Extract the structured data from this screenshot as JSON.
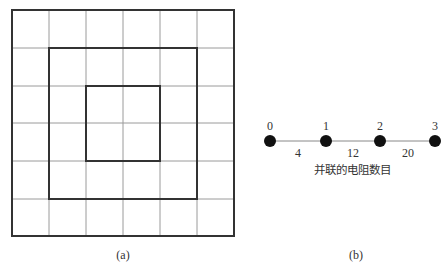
{
  "panel_a": {
    "caption": "(a)",
    "grid": {
      "rows": 6,
      "cols": 6,
      "cell_px": 37
    },
    "squares": [
      {
        "name": "outer",
        "cells": 6
      },
      {
        "name": "middle",
        "cells": 4
      },
      {
        "name": "inner",
        "cells": 2
      }
    ]
  },
  "panel_b": {
    "caption": "(b)",
    "axis_label": "并联的电阻数目",
    "nodes": [
      {
        "label": "0"
      },
      {
        "label": "1"
      },
      {
        "label": "2"
      },
      {
        "label": "3"
      }
    ],
    "edges": [
      {
        "label": "4"
      },
      {
        "label": "12"
      },
      {
        "label": "20"
      }
    ]
  },
  "colors": {
    "line": "#333333",
    "grid": "#9a9a9a",
    "node": "#111111"
  }
}
